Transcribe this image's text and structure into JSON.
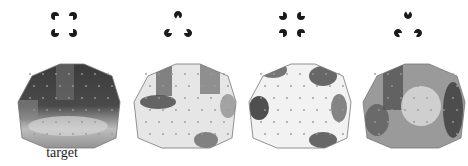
{
  "figure": {
    "panels": [
      {
        "id": "illusory-square",
        "stimulus": "kanizsa-square-inducers-inward",
        "label": "target"
      },
      {
        "id": "illusory-triangle",
        "stimulus": "kanizsa-triangle-inducers-inward",
        "label": ""
      },
      {
        "id": "non-illusory-square",
        "stimulus": "square-inducers-rotated-outward",
        "label": ""
      },
      {
        "id": "non-illusory-triangle",
        "stimulus": "triangle-inducers-rotated-outward",
        "label": ""
      }
    ],
    "target_label": "target"
  },
  "colors": {
    "inducer": "#1a1a1a",
    "outline": "#777777",
    "electrode": "#999999"
  }
}
